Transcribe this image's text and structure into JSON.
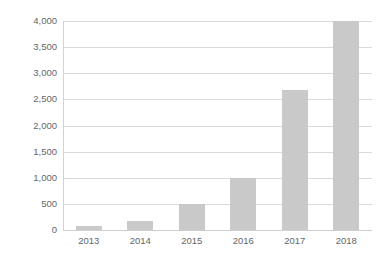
{
  "chart_data": {
    "type": "bar",
    "title": "",
    "subtitle": "",
    "xlabel": "",
    "ylabel": "",
    "categories": [
      "2013",
      "2014",
      "2015",
      "2016",
      "2017",
      "2018"
    ],
    "values": [
      80,
      165,
      500,
      1000,
      2680,
      4000
    ],
    "series": [
      {
        "name": "",
        "values": [
          80,
          165,
          500,
          1000,
          2680,
          4000
        ]
      }
    ],
    "ylim": [
      0,
      4000
    ],
    "y_tick_values": [
      0,
      500,
      1000,
      1500,
      2000,
      2500,
      3000,
      3500,
      4000
    ],
    "y_tick_labels": [
      "0",
      "500",
      "1,000",
      "1,500",
      "2,000",
      "2,500",
      "3,000",
      "3,500",
      "4,000"
    ],
    "grid": true,
    "grid_axis": "y",
    "legend": false,
    "legend_position": "none",
    "annotations": [],
    "colors": {
      "bar": "#c9c9c9",
      "gridline": "#d9d9d9",
      "axis_line": "#d2d2d2",
      "tick_label": "#63666a",
      "background": "#ffffff"
    }
  }
}
